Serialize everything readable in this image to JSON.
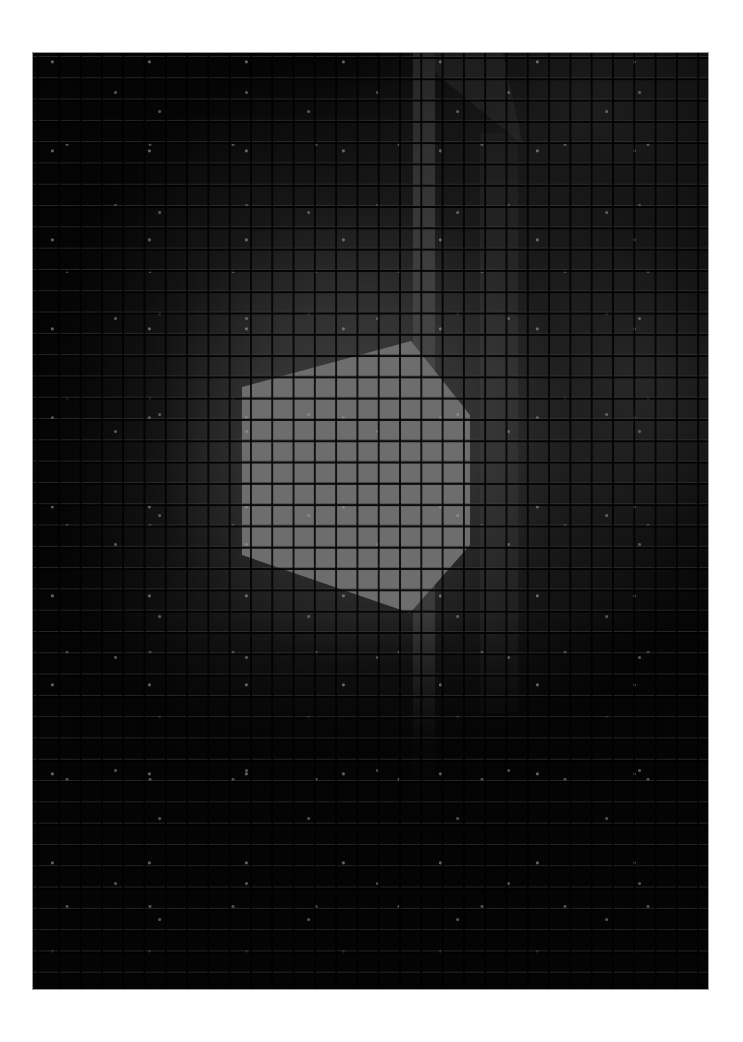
{
  "image": {
    "description": "Grayscale tiled detector/microscopy image with a bright irregular hexagonal region and a bright vertical stripe",
    "frame": {
      "x": 33,
      "y": 53,
      "width": 675,
      "height": 936
    },
    "grid": {
      "cell_size_px": 21.3,
      "columns": 32,
      "rows": 44
    },
    "colors": {
      "page_background": "#ffffff",
      "dark_background": "#050505",
      "mid_gray_region": "#303030",
      "vertical_stripe": "#3f3f3f",
      "hexagon_fill": "#6b6b6b",
      "gridline": "#0a0a0a"
    },
    "hexagon_vertices_page_px": [
      [
        242,
        387
      ],
      [
        411,
        341
      ],
      [
        470,
        415
      ],
      [
        470,
        545
      ],
      [
        410,
        613
      ],
      [
        242,
        555
      ]
    ],
    "vertical_stripe_page_px": {
      "x": 413,
      "y_top": 53,
      "width": 22,
      "y_bottom": 837
    }
  }
}
